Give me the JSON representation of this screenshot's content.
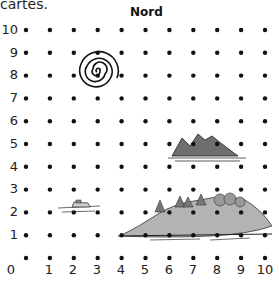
{
  "caption": "cartes.",
  "compass_label": "Nord",
  "y_labels": [
    "10",
    "9",
    "8",
    "7",
    "6",
    "5",
    "4",
    "3",
    "2",
    "1"
  ],
  "x_labels": [
    "0",
    "1",
    "2",
    "3",
    "4",
    "5",
    "6",
    "7",
    "8",
    "9",
    "10"
  ],
  "grid": {
    "cols": 11,
    "rows": 11,
    "x_range": [
      0,
      10
    ],
    "y_range": [
      0,
      10
    ]
  },
  "features": [
    {
      "name": "spiral",
      "center": [
        3,
        8
      ]
    },
    {
      "name": "mountain-island",
      "center": [
        8,
        4.7
      ]
    },
    {
      "name": "boat",
      "center": [
        2.7,
        2.2
      ]
    },
    {
      "name": "forested-island",
      "center": [
        7.6,
        1.6
      ]
    }
  ],
  "colors": {
    "dot": "#111111",
    "land": "#a8a8a8",
    "mountain": "#6e6e6e"
  }
}
